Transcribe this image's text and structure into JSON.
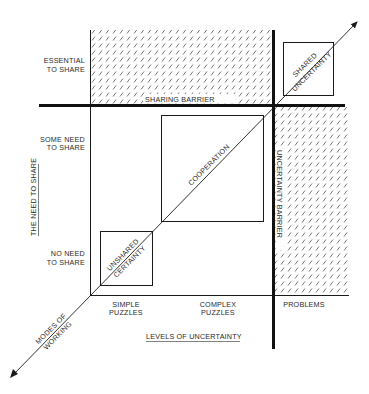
{
  "colors": {
    "ink": "#1a1a1a",
    "hatch": "#555555",
    "background": "#ffffff"
  },
  "y_axis": {
    "title": "THE NEED TO SHARE",
    "levels": [
      {
        "line1": "ESSENTIAL",
        "line2": "TO SHARE"
      },
      {
        "line1": "SOME NEED",
        "line2": "TO SHARE"
      },
      {
        "line1": "NO NEED",
        "line2": "TO SHARE"
      }
    ]
  },
  "x_axis": {
    "title": "LEVELS OF UNCERTAINTY",
    "levels": [
      {
        "line1": "SIMPLE",
        "line2": "PUZZLES"
      },
      {
        "line1": "COMPLEX",
        "line2": "PUZZLES"
      },
      {
        "line1": "PROBLEMS",
        "line2": ""
      }
    ]
  },
  "barriers": {
    "sharing": "SHARING BARRIER",
    "uncertainty": "UNCERTAINTY BARRIER"
  },
  "diagonal": {
    "line1": "MODES OF",
    "line2": "WORKING"
  },
  "boxes": {
    "unshared_certainty": {
      "line1": "UNSHARED",
      "line2": "CERTAINTY"
    },
    "cooperation": {
      "line1": "COOPERATION"
    },
    "shared_uncertainty": {
      "line1": "SHARED",
      "line2": "UNCERTAINTY"
    }
  }
}
